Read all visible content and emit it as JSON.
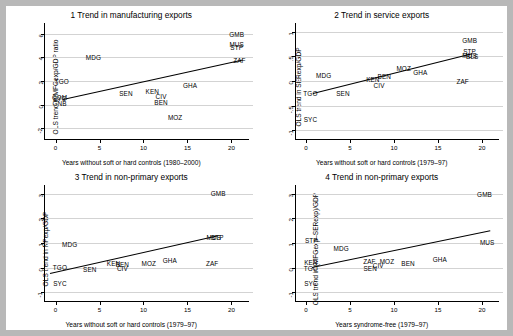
{
  "figure": {
    "background": "#ffffff",
    "page_background": "#b8b8b8",
    "grid_color": "#d3d3d3",
    "line_color": "#000000"
  },
  "chart_data": [
    {
      "type": "scatter",
      "title": "1  Trend in manufacturing exports",
      "xlabel": "Years without soft or hard controls (1980–2000)",
      "ylabel": "OLS trend in MFGexp/GDP ratio",
      "xlim": [
        -1.2,
        22
      ],
      "ylim": [
        -2.9,
        6.9
      ],
      "xticks": [
        0,
        5,
        10,
        15,
        20
      ],
      "xticklabels": [
        "0",
        "5",
        "10",
        "15",
        "20"
      ],
      "yticks": [
        -2,
        0,
        2,
        4,
        6
      ],
      "yticklabels": [
        "-2",
        "0",
        "2",
        "4",
        "6"
      ],
      "grid": true,
      "legend": "none",
      "points": [
        {
          "label": "GMB",
          "x": 20.6,
          "y": 6.0
        },
        {
          "label": "MUS",
          "x": 20.6,
          "y": 5.15
        },
        {
          "label": "STP",
          "x": 20.6,
          "y": 4.85
        },
        {
          "label": "ZAF",
          "x": 20.9,
          "y": 3.75
        },
        {
          "label": "MDG",
          "x": 4.3,
          "y": 4.05
        },
        {
          "label": "TGO",
          "x": 0.7,
          "y": 2.0
        },
        {
          "label": "GHA",
          "x": 15.3,
          "y": 1.65
        },
        {
          "label": "SEN",
          "x": 8.0,
          "y": 1.0
        },
        {
          "label": "KEN",
          "x": 11.0,
          "y": 1.15
        },
        {
          "label": "CIV",
          "x": 12.0,
          "y": 0.75
        },
        {
          "label": "BEN",
          "x": 12.0,
          "y": 0.25
        },
        {
          "label": "COM",
          "x": 0.45,
          "y": 0.62
        },
        {
          "label": "SYC",
          "x": 0.45,
          "y": 0.55
        },
        {
          "label": "GNB",
          "x": 0.45,
          "y": 0.1
        },
        {
          "label": "MOZ",
          "x": 13.6,
          "y": -1.05
        }
      ],
      "fit": {
        "x0": 0.9,
        "y0": 0.52,
        "x1": 21.3,
        "y1": 3.85
      }
    },
    {
      "type": "scatter",
      "title": "2  Trend in service exports",
      "xlabel": "Years without soft or hard controls (1979–97)",
      "ylabel": "OLS trend in SERexp/GDP",
      "xlim": [
        -1.2,
        22
      ],
      "ylim": [
        -1.18,
        1.18
      ],
      "xticks": [
        0,
        5,
        10,
        15,
        20
      ],
      "xticklabels": [
        "0",
        "5",
        "10",
        "15",
        "20"
      ],
      "yticks": [
        -1,
        -0.5,
        0,
        0.5,
        1
      ],
      "yticklabels": [
        "-1",
        "-.5",
        "0",
        ".5",
        "1"
      ],
      "grid": true,
      "legend": "none",
      "points": [
        {
          "label": "GMB",
          "x": 18.6,
          "y": 0.83
        },
        {
          "label": "STP",
          "x": 18.6,
          "y": 0.62
        },
        {
          "label": "MUS",
          "x": 18.6,
          "y": 0.52
        },
        {
          "label": "BLS",
          "x": 18.9,
          "y": 0.5
        },
        {
          "label": "MDG",
          "x": 2.0,
          "y": 0.13
        },
        {
          "label": "MOZ",
          "x": 11.1,
          "y": 0.27
        },
        {
          "label": "GHA",
          "x": 13.0,
          "y": 0.19
        },
        {
          "label": "ZAF",
          "x": 17.8,
          "y": 0.0
        },
        {
          "label": "BEN",
          "x": 8.9,
          "y": 0.1
        },
        {
          "label": "KEN",
          "x": 7.6,
          "y": 0.05
        },
        {
          "label": "CIV",
          "x": 8.3,
          "y": -0.08
        },
        {
          "label": "TGO",
          "x": 0.5,
          "y": -0.25
        },
        {
          "label": "SEN",
          "x": 4.2,
          "y": -0.25
        },
        {
          "label": "SYC",
          "x": 0.5,
          "y": -0.78
        }
      ],
      "fit": {
        "x0": 0.8,
        "y0": -0.25,
        "x1": 18.9,
        "y1": 0.56
      }
    },
    {
      "type": "scatter",
      "title": "3  Trend in non-primary exports",
      "xlabel": "Years without soft or hard controls (1979–97)",
      "ylabel": "OLS trend in NPexp/GDP",
      "xlim": [
        -1.2,
        22
      ],
      "ylim": [
        -1.35,
        3.35
      ],
      "xticks": [
        0,
        5,
        10,
        15,
        20
      ],
      "xticklabels": [
        "0",
        "5",
        "10",
        "15",
        "20"
      ],
      "yticks": [
        -1,
        0,
        1,
        2,
        3
      ],
      "yticklabels": [
        "-1",
        "0",
        "1",
        "2",
        "3"
      ],
      "grid": true,
      "legend": "none",
      "points": [
        {
          "label": "GMB",
          "x": 18.5,
          "y": 3.03
        },
        {
          "label": "MUS",
          "x": 18.0,
          "y": 1.25
        },
        {
          "label": "STP",
          "x": 18.4,
          "y": 1.25
        },
        {
          "label": "MDG",
          "x": 1.6,
          "y": 0.95
        },
        {
          "label": "GHA",
          "x": 13.0,
          "y": 0.32
        },
        {
          "label": "MOZ",
          "x": 10.6,
          "y": 0.18
        },
        {
          "label": "ZAF",
          "x": 17.8,
          "y": 0.2
        },
        {
          "label": "KEN",
          "x": 6.6,
          "y": 0.18
        },
        {
          "label": "BEN",
          "x": 7.6,
          "y": 0.16
        },
        {
          "label": "CIV",
          "x": 7.6,
          "y": 0.0
        },
        {
          "label": "SEN",
          "x": 3.9,
          "y": -0.05
        },
        {
          "label": "TGO",
          "x": 0.5,
          "y": 0.02
        },
        {
          "label": "SYC",
          "x": 0.5,
          "y": -0.62
        }
      ],
      "fit": {
        "x0": -0.6,
        "y0": -0.22,
        "x1": 18.4,
        "y1": 1.3
      }
    },
    {
      "type": "scatter",
      "title": "4  Trend in non-primary exports",
      "xlabel": "Years syndrome-free (1979–97)",
      "ylabel": "OLS trend in (MFGexp–SERexp)/GDP",
      "xlim": [
        -1.2,
        22
      ],
      "ylim": [
        -1.35,
        3.35
      ],
      "xticks": [
        0,
        5,
        10,
        15,
        20
      ],
      "xticklabels": [
        "0",
        "5",
        "10",
        "15",
        "20"
      ],
      "yticks": [
        -1,
        0,
        1,
        2,
        3
      ],
      "yticklabels": [
        "-1",
        "0",
        "1",
        "2",
        "3"
      ],
      "grid": true,
      "legend": "none",
      "points": [
        {
          "label": "GMB",
          "x": 20.3,
          "y": 3.0
        },
        {
          "label": "MUS",
          "x": 20.6,
          "y": 1.05
        },
        {
          "label": "STP",
          "x": 0.6,
          "y": 1.12
        },
        {
          "label": "MDG",
          "x": 4.0,
          "y": 0.78
        },
        {
          "label": "GHA",
          "x": 15.2,
          "y": 0.37
        },
        {
          "label": "MOZ",
          "x": 9.2,
          "y": 0.28
        },
        {
          "label": "ZAF",
          "x": 7.2,
          "y": 0.27
        },
        {
          "label": "BEN",
          "x": 11.6,
          "y": 0.2
        },
        {
          "label": "CIV",
          "x": 8.2,
          "y": 0.12
        },
        {
          "label": "KEN",
          "x": 0.55,
          "y": 0.22
        },
        {
          "label": "TGO",
          "x": 0.55,
          "y": 0.0
        },
        {
          "label": "SEN",
          "x": 7.3,
          "y": 0.0
        },
        {
          "label": "SYC",
          "x": 0.55,
          "y": -0.62
        }
      ],
      "fit": {
        "x0": 0.7,
        "y0": 0.03,
        "x1": 21.0,
        "y1": 1.52
      }
    }
  ]
}
